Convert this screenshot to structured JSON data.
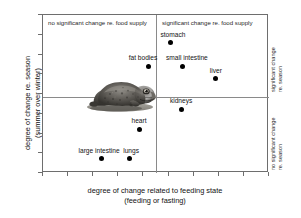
{
  "chart_data": {
    "type": "scatter",
    "title": "",
    "xlabel_line1": "degree of change related to feeding state",
    "xlabel_line2": "(feeding or fasting)",
    "ylabel_line1": "degree of change re. season",
    "ylabel_line2": "(summer over winter)",
    "xlim": [
      0,
      100
    ],
    "ylim": [
      0,
      100
    ],
    "grid": false,
    "axis_tick_labels": [],
    "quadrant_divider_x": 50,
    "quadrant_divider_y": 50,
    "quadrant_headers": {
      "top_left": "no significant change re. food supply",
      "top_right": "significant change re. food supply"
    },
    "side_annotations": {
      "upper_line1": "significant change",
      "upper_line2": "re. season",
      "lower_line1": "no significant change",
      "lower_line2": "re. season"
    },
    "points": [
      {
        "label": "fat bodies",
        "x": 46.9,
        "y": 67.7,
        "label_dx": -6,
        "label_dy": -4
      },
      {
        "label": "stomach",
        "x": 56.6,
        "y": 82.3,
        "label_dx": 2,
        "label_dy": -4
      },
      {
        "label": "small intestine",
        "x": 61.9,
        "y": 67.7,
        "label_dx": 4,
        "label_dy": -4
      },
      {
        "label": "liver",
        "x": 76.5,
        "y": 59.5,
        "label_dx": 0,
        "label_dy": -4
      },
      {
        "label": "kidneys",
        "x": 61.1,
        "y": 40.5,
        "label_dx": 0,
        "label_dy": -4
      },
      {
        "label": "heart",
        "x": 42.5,
        "y": 27.8,
        "label_dx": 0,
        "label_dy": -4
      },
      {
        "label": "large intestine",
        "x": 25.7,
        "y": 8.9,
        "label_dx": -2,
        "label_dy": -4
      },
      {
        "label": "lungs",
        "x": 38.1,
        "y": 8.9,
        "label_dx": 2,
        "label_dy": -4
      }
    ]
  },
  "inset": {
    "photo_alt": "frog-photograph"
  }
}
